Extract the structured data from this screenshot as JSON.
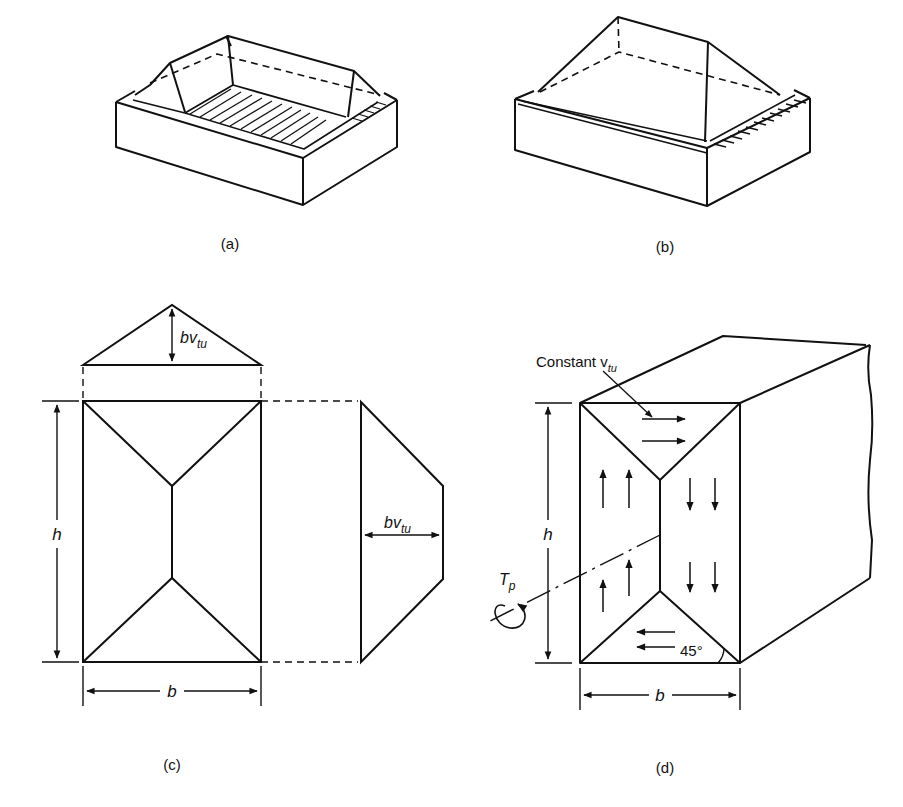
{
  "figure": {
    "panels": [
      {
        "id": "a",
        "caption": "(a)",
        "description": "Box section with roof-shaped sand-heap above, hatched interior bottom"
      },
      {
        "id": "b",
        "caption": "(b)",
        "description": "Box section with hipped sand-heap roof over full top"
      },
      {
        "id": "c",
        "caption": "(c)",
        "description": "Plan view of rectangle with sand-heap ridge lines and elevations"
      },
      {
        "id": "d",
        "caption": "(d)",
        "description": "Rectangular member under torsion with constant shear flow arrows"
      }
    ],
    "labels": {
      "bv_tu_top": "bv",
      "bv_tu_top_sub": "tu",
      "bv_tu_side": "bv",
      "bv_tu_side_sub": "tu",
      "h_c": "h",
      "b_c": "b",
      "constant": "Constant v",
      "constant_sub": "tu",
      "h_d": "h",
      "b_d": "b",
      "torque": "T",
      "torque_sub": "p",
      "angle": "45°"
    },
    "colors": {
      "ink": "#111111",
      "background": "#ffffff"
    }
  }
}
